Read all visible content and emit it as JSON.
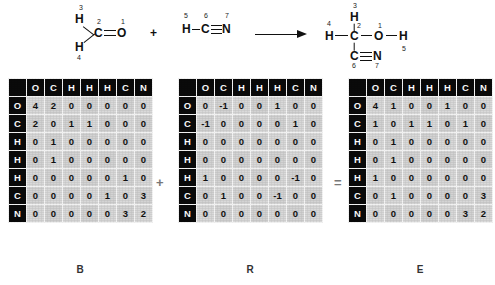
{
  "reaction": {
    "reactant1": {
      "name": "formaldehyde",
      "atoms": [
        {
          "id": "a1",
          "symbol": "O",
          "index": "1"
        },
        {
          "id": "a2",
          "symbol": "C",
          "index": "2"
        },
        {
          "id": "a3",
          "symbol": "H",
          "index": "3"
        },
        {
          "id": "a4",
          "symbol": "H",
          "index": "4"
        }
      ]
    },
    "plus_operator": "+",
    "reactant2": {
      "name": "hydrogen-cyanide",
      "atoms": [
        {
          "id": "a5",
          "symbol": "H",
          "index": "5"
        },
        {
          "id": "a6",
          "symbol": "C",
          "index": "6"
        },
        {
          "id": "a7",
          "symbol": "N",
          "index": "7"
        }
      ]
    },
    "arrow": "reaction-arrow",
    "product": {
      "name": "glycolonitrile",
      "atoms": [
        {
          "id": "p3",
          "symbol": "H",
          "index": "3"
        },
        {
          "id": "p4",
          "symbol": "H",
          "index": "4"
        },
        {
          "id": "p2",
          "symbol": "C",
          "index": "2"
        },
        {
          "id": "p1",
          "symbol": "O",
          "index": "1"
        },
        {
          "id": "p5",
          "symbol": "H",
          "index": "5"
        },
        {
          "id": "p6",
          "symbol": "C",
          "index": "6"
        },
        {
          "id": "p7",
          "symbol": "N",
          "index": "7"
        }
      ]
    }
  },
  "matrix_operators": {
    "plus": "+",
    "equals": "="
  },
  "chart_data": {
    "type": "table",
    "matrices": [
      {
        "caption": "B",
        "name": "bond-electron-matrix-reactants",
        "col_headers": [
          "O",
          "C",
          "H",
          "H",
          "H",
          "C",
          "N"
        ],
        "row_headers": [
          "O",
          "C",
          "H",
          "H",
          "H",
          "C",
          "N"
        ],
        "rows": [
          [
            "4",
            "2",
            "0",
            "0",
            "0",
            "0",
            "0"
          ],
          [
            "2",
            "0",
            "1",
            "1",
            "0",
            "0",
            "0"
          ],
          [
            "0",
            "1",
            "0",
            "0",
            "0",
            "0",
            "0"
          ],
          [
            "0",
            "1",
            "0",
            "0",
            "0",
            "0",
            "0"
          ],
          [
            "0",
            "0",
            "0",
            "0",
            "0",
            "1",
            "0"
          ],
          [
            "0",
            "0",
            "0",
            "0",
            "1",
            "0",
            "3"
          ],
          [
            "0",
            "0",
            "0",
            "0",
            "0",
            "3",
            "2"
          ]
        ]
      },
      {
        "caption": "R",
        "name": "reaction-matrix",
        "col_headers": [
          "O",
          "C",
          "H",
          "H",
          "H",
          "C",
          "N"
        ],
        "row_headers": [
          "O",
          "C",
          "H",
          "H",
          "H",
          "C",
          "N"
        ],
        "rows": [
          [
            "0",
            "-1",
            "0",
            "0",
            "1",
            "0",
            "0"
          ],
          [
            "-1",
            "0",
            "0",
            "0",
            "0",
            "1",
            "0"
          ],
          [
            "0",
            "0",
            "0",
            "0",
            "0",
            "0",
            "0"
          ],
          [
            "0",
            "0",
            "0",
            "0",
            "0",
            "0",
            "0"
          ],
          [
            "1",
            "0",
            "0",
            "0",
            "0",
            "-1",
            "0"
          ],
          [
            "0",
            "1",
            "0",
            "0",
            "-1",
            "0",
            "0"
          ],
          [
            "0",
            "0",
            "0",
            "0",
            "0",
            "0",
            "0"
          ]
        ]
      },
      {
        "caption": "E",
        "name": "bond-electron-matrix-product",
        "col_headers": [
          "O",
          "C",
          "H",
          "H",
          "H",
          "C",
          "N"
        ],
        "row_headers": [
          "O",
          "C",
          "H",
          "H",
          "H",
          "C",
          "N"
        ],
        "rows": [
          [
            "4",
            "1",
            "0",
            "0",
            "1",
            "0",
            "0"
          ],
          [
            "1",
            "0",
            "1",
            "1",
            "0",
            "1",
            "0"
          ],
          [
            "0",
            "1",
            "0",
            "0",
            "0",
            "0",
            "0"
          ],
          [
            "0",
            "1",
            "0",
            "0",
            "0",
            "0",
            "0"
          ],
          [
            "1",
            "0",
            "0",
            "0",
            "0",
            "0",
            "0"
          ],
          [
            "0",
            "1",
            "0",
            "0",
            "0",
            "0",
            "3"
          ],
          [
            "0",
            "0",
            "0",
            "0",
            "0",
            "3",
            "2"
          ]
        ]
      }
    ]
  }
}
